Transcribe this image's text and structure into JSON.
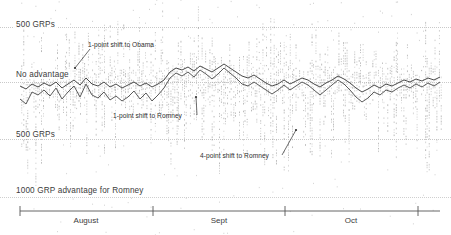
{
  "chart_data": {
    "type": "scatter",
    "title": "",
    "subtitle": "",
    "xlabel": "",
    "ylabel": "GRP advantage",
    "grid": true,
    "legend_position": "none",
    "x_axis": {
      "ticks": [
        "August",
        "Sept",
        "Oct"
      ],
      "tick_positions_px": [
        20,
        153,
        285,
        418
      ],
      "label_positions_px": [
        86,
        219,
        351
      ]
    },
    "y_axis": {
      "reference_lines": [
        {
          "label": "500 GRPs",
          "y_px": 27,
          "value": 500
        },
        {
          "label": "No advantage",
          "y_px": 82,
          "value": 0
        },
        {
          "label": "500 GRPs",
          "y_px": 139,
          "value": -500
        },
        {
          "label": "1000 GRP advantage for Romney",
          "y_px": 197,
          "value": -1000
        }
      ],
      "ylim": [
        -1100,
        700
      ]
    },
    "annotations": [
      {
        "text": "1-point shift to Obama",
        "x_px": 88,
        "y_px": 45,
        "leader_to_x": 75,
        "leader_to_y": 68
      },
      {
        "text": "1-point shift to Romney",
        "x_px": 113,
        "y_px": 116,
        "leader_to_x": 196,
        "leader_to_y": 97
      },
      {
        "text": "4-point shift to Romney",
        "x_px": 200,
        "y_px": 156,
        "leader_to_x": 296,
        "leader_to_y": 130
      }
    ],
    "series": [
      {
        "name": "trend-line-upper",
        "color": "#4a4a4a",
        "x": [
          20,
          26,
          32,
          38,
          44,
          50,
          56,
          62,
          68,
          74,
          80,
          86,
          92,
          98,
          104,
          110,
          116,
          122,
          128,
          134,
          140,
          146,
          152,
          158,
          164,
          170,
          176,
          182,
          188,
          194,
          200,
          206,
          212,
          218,
          224,
          230,
          236,
          242,
          248,
          254,
          260,
          266,
          272,
          278,
          284,
          290,
          296,
          302,
          308,
          314,
          320,
          326,
          332,
          338,
          344,
          350,
          356,
          362,
          368,
          374,
          380,
          386,
          392,
          398,
          404,
          410,
          416,
          422,
          428,
          434,
          440
        ],
        "y": [
          86,
          89,
          84,
          87,
          83,
          86,
          82,
          88,
          84,
          80,
          85,
          78,
          84,
          86,
          82,
          87,
          84,
          88,
          85,
          82,
          86,
          83,
          87,
          84,
          80,
          72,
          68,
          70,
          67,
          71,
          66,
          69,
          72,
          68,
          64,
          68,
          72,
          76,
          78,
          75,
          79,
          83,
          86,
          84,
          80,
          84,
          81,
          78,
          80,
          84,
          87,
          83,
          80,
          76,
          79,
          83,
          88,
          92,
          89,
          85,
          88,
          84,
          86,
          83,
          80,
          82,
          79,
          81,
          78,
          80,
          77
        ]
      },
      {
        "name": "trend-line-lower",
        "color": "#5a5a5a",
        "x": [
          20,
          26,
          32,
          38,
          44,
          50,
          56,
          62,
          68,
          74,
          80,
          86,
          92,
          98,
          104,
          110,
          116,
          122,
          128,
          134,
          140,
          146,
          152,
          158,
          164,
          170,
          176,
          182,
          188,
          194,
          200,
          206,
          212,
          218,
          224,
          230,
          236,
          242,
          248,
          254,
          260,
          266,
          272,
          278,
          284,
          290,
          296,
          302,
          308,
          314,
          320,
          326,
          332,
          338,
          344,
          350,
          356,
          362,
          368,
          374,
          380,
          386,
          392,
          398,
          404,
          410,
          416,
          422,
          428,
          434,
          440
        ],
        "y": [
          99,
          104,
          92,
          95,
          90,
          96,
          88,
          99,
          92,
          86,
          97,
          84,
          95,
          98,
          92,
          100,
          96,
          101,
          97,
          91,
          99,
          93,
          101,
          95,
          88,
          78,
          73,
          76,
          72,
          77,
          70,
          74,
          79,
          74,
          68,
          73,
          78,
          84,
          86,
          82,
          86,
          90,
          94,
          90,
          85,
          90,
          86,
          82,
          85,
          90,
          95,
          90,
          85,
          80,
          84,
          90,
          97,
          102,
          98,
          92,
          95,
          90,
          92,
          88,
          85,
          88,
          84,
          87,
          83,
          86,
          82
        ]
      }
    ],
    "stem_description": "dense gray vertical dotted stems with scattered dots spanning full plot height",
    "stem_count": 215
  },
  "labels": {
    "grp_top": "500 GRPs",
    "no_advantage": "No advantage",
    "grp_bottom": "500 GRPs",
    "grp_romney": "1000 GRP advantage for Romney",
    "annotation_obama": "1-point shift to Obama",
    "annotation_romney_1": "1-point shift to Romney",
    "annotation_romney_4": "4-point shift to Romney",
    "month_august": "August",
    "month_sept": "Sept",
    "month_oct": "Oct"
  },
  "colors": {
    "background": "#ffffff",
    "text": "#3c3c3c",
    "gridline": "#c9c9c9",
    "stem": "#9a9a9a",
    "line_upper": "#4a4a4a",
    "line_lower": "#5a5a5a",
    "axis": "#555555"
  }
}
